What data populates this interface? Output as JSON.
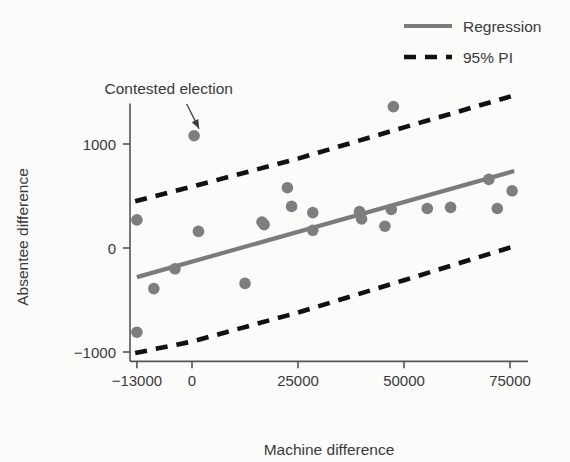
{
  "chart_data": {
    "type": "scatter",
    "title": "",
    "xlabel": "Machine difference",
    "ylabel": "Absentee difference",
    "xlim": [
      -16000,
      79000
    ],
    "ylim": [
      -1150,
      1500
    ],
    "xticks": [
      -13000,
      0,
      25000,
      50000,
      75000
    ],
    "xtick_labels": [
      "−13000",
      "0",
      "25000",
      "50000",
      "75000"
    ],
    "yticks": [
      1000,
      0,
      -1000
    ],
    "ytick_labels": [
      "1000",
      "0",
      "−1000"
    ],
    "grid": false,
    "legend_position": "top-right",
    "point_color": "#7e7e7e",
    "regression_color": "#7b7b7b",
    "pi_color": "#111111",
    "points": [
      {
        "x": -13000,
        "y": -810
      },
      {
        "x": -13000,
        "y": 270
      },
      {
        "x": -9000,
        "y": -390
      },
      {
        "x": -4000,
        "y": -200
      },
      {
        "x": 500,
        "y": 1080
      },
      {
        "x": 1500,
        "y": 160
      },
      {
        "x": 12500,
        "y": -340
      },
      {
        "x": 16500,
        "y": 250
      },
      {
        "x": 17000,
        "y": 225
      },
      {
        "x": 22500,
        "y": 580
      },
      {
        "x": 23500,
        "y": 400
      },
      {
        "x": 28500,
        "y": 340
      },
      {
        "x": 28500,
        "y": 170
      },
      {
        "x": 39500,
        "y": 350
      },
      {
        "x": 40000,
        "y": 280
      },
      {
        "x": 45500,
        "y": 210
      },
      {
        "x": 47500,
        "y": 1360
      },
      {
        "x": 47000,
        "y": 370
      },
      {
        "x": 55500,
        "y": 380
      },
      {
        "x": 61000,
        "y": 390
      },
      {
        "x": 70000,
        "y": 660
      },
      {
        "x": 72000,
        "y": 380
      },
      {
        "x": 75500,
        "y": 550
      }
    ],
    "regression": {
      "name": "Regression",
      "x_start": -13000,
      "y_start": -280,
      "x_end": 76000,
      "y_end": 740
    },
    "prediction_interval": {
      "name": "95% PI",
      "upper": [
        {
          "x": -13400,
          "y": 450
        },
        {
          "x": 0,
          "y": 590
        },
        {
          "x": 25000,
          "y": 860
        },
        {
          "x": 50000,
          "y": 1160
        },
        {
          "x": 77000,
          "y": 1480
        }
      ],
      "lower": [
        {
          "x": -13400,
          "y": -1010
        },
        {
          "x": 0,
          "y": -900
        },
        {
          "x": 25000,
          "y": -620
        },
        {
          "x": 50000,
          "y": -310
        },
        {
          "x": 77000,
          "y": 30
        }
      ]
    },
    "annotations": [
      {
        "text": "Contested election",
        "target_x": 500,
        "target_y": 1080,
        "label_x": -5500,
        "label_y": 1480
      }
    ],
    "legend": [
      {
        "label": "Regression",
        "style": "solid",
        "color": "#7b7b7b"
      },
      {
        "label": "95% PI",
        "style": "dashed",
        "color": "#111111"
      }
    ]
  }
}
